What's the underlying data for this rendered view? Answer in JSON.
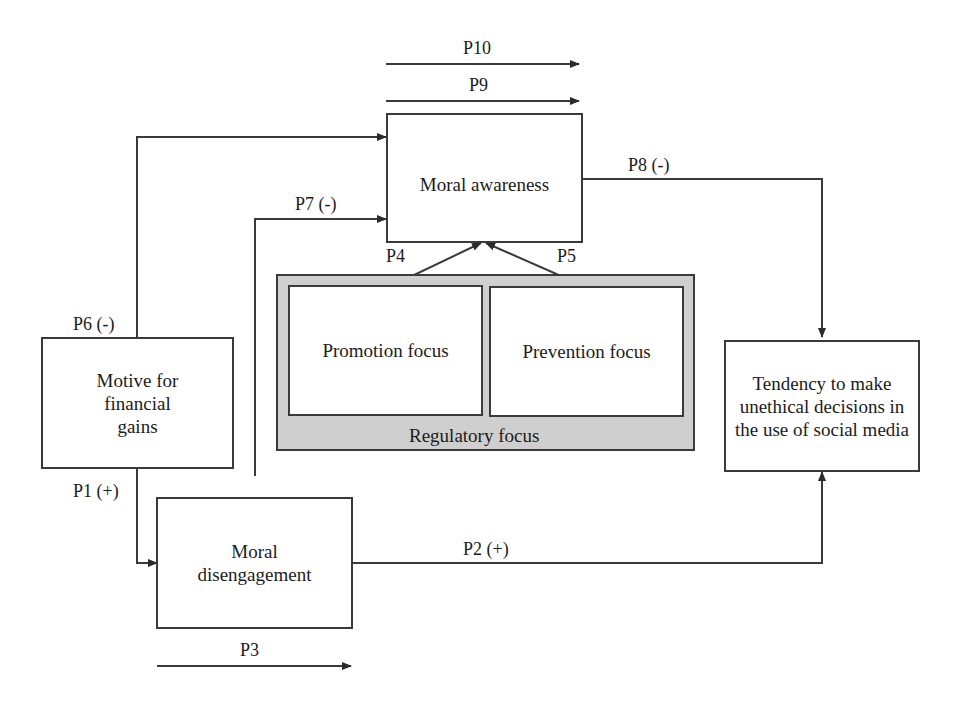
{
  "diagram": {
    "nodes": {
      "moral_awareness": "Moral awareness",
      "motive": "Motive for financial gains",
      "moral_disengagement": "Moral disengagement",
      "promotion_focus": "Promotion focus",
      "prevention_focus": "Prevention focus",
      "regulatory_focus": "Regulatory focus",
      "tendency": "Tendency to make unethical decisions in the use of social media"
    },
    "paths": {
      "p1": "P1 (+)",
      "p2": "P2 (+)",
      "p3": "P3",
      "p4": "P4",
      "p5": "P5",
      "p6": "P6 (-)",
      "p7": "P7 (-)",
      "p8": "P8 (-)",
      "p9": "P9",
      "p10": "P10"
    },
    "edges": [
      {
        "from": "Motive for financial gains",
        "to": "Moral disengagement",
        "label": "P1 (+)"
      },
      {
        "from": "Moral disengagement",
        "to": "Tendency to make unethical decisions in the use of social media",
        "label": "P2 (+)"
      },
      {
        "from": "Promotion focus",
        "to": "Moral awareness",
        "label": "P4"
      },
      {
        "from": "Prevention focus",
        "to": "Moral awareness",
        "label": "P5"
      },
      {
        "from": "Motive for financial gains",
        "to": "Moral awareness",
        "label": "P6 (-)"
      },
      {
        "from": "Moral disengagement",
        "to": "Moral awareness",
        "label": "P7 (-)"
      },
      {
        "from": "Moral awareness",
        "to": "Tendency to make unethical decisions in the use of social media",
        "label": "P8 (-)"
      }
    ],
    "colors": {
      "line": "#3a3a3a",
      "group_fill": "#cfcfcf",
      "box_fill": "#ffffff"
    }
  }
}
